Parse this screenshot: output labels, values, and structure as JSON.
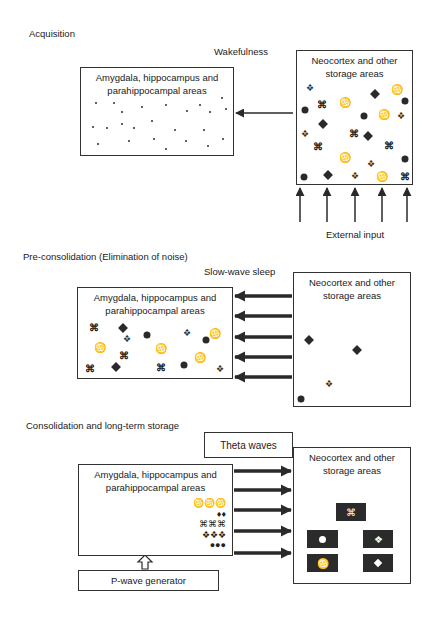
{
  "sections": {
    "acquisition": {
      "title": "Acquisition",
      "state_label": "Wakefulness",
      "left_box": {
        "title_line1": "Amygdala, hippocampus and",
        "title_line2": "parahippocampal areas"
      },
      "right_box": {
        "title_line1": "Neocortex and other",
        "title_line2": "storage areas"
      },
      "input_label": "External input"
    },
    "pre_consolidation": {
      "title": "Pre-consolidation (Elimination of noise)",
      "state_label": "Slow-wave sleep",
      "left_box": {
        "title_line1": "Amygdala, hippocampus and",
        "title_line2": "parahippocampal areas"
      },
      "right_box": {
        "title_line1": "Neocortex and other",
        "title_line2": "storage areas"
      }
    },
    "consolidation": {
      "title": "Consolidation and long-term storage",
      "state_label": "Theta waves",
      "left_box": {
        "title_line1": "Amygdala, hippocampus and",
        "title_line2": "parahippocampal areas",
        "stack": [
          "♋♋♋",
          "♦♦",
          "⌘⌘⌘",
          "❖❖❖",
          "●●●"
        ]
      },
      "right_box": {
        "title_line1": "Neocortex and other",
        "title_line2": "storage areas"
      },
      "generator_label": "P-wave generator"
    }
  },
  "symbols": {
    "cmd": "⌘",
    "cancer": "♋",
    "clover": "❖"
  },
  "colors": {
    "stroke": "#333333",
    "fill_dark": "#2b2b2b",
    "background": "#ffffff"
  }
}
